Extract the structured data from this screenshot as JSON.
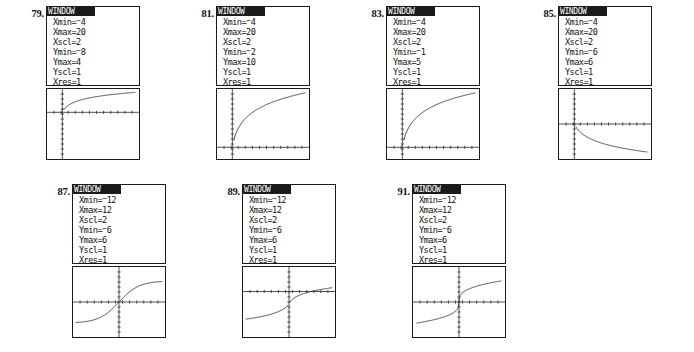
{
  "document": {
    "kind": "graphing-calculator-answer-key",
    "rows": 2,
    "panel_count": 7
  },
  "labels": {
    "window_title": "WINDOW",
    "xmin": "Xmin=",
    "xmax": "Xmax=",
    "xscl": "Xscl=",
    "ymin": "Ymin=",
    "ymax": "Ymax=",
    "yscl": "Yscl=",
    "xres": "Xres="
  },
  "panels": [
    {
      "number": "79.",
      "window": {
        "Xmin": "-4",
        "Xmin_negated": true,
        "Xmax": "20",
        "Xscl": "2",
        "Ymin": "8",
        "Ymin_negated": true,
        "Ymax": "4",
        "Yscl": "1",
        "Xres": "1"
      },
      "graph": {
        "type": "logarithmic-increasing",
        "description": "increasing logarithmic curve with vertical asymptote near x=0",
        "xaxis_fraction": 0.333,
        "yaxis_fraction": 0.1667
      }
    },
    {
      "number": "81.",
      "window": {
        "Xmin": "-4",
        "Xmin_negated": true,
        "Xmax": "20",
        "Xscl": "2",
        "Ymin": "2",
        "Ymin_negated": true,
        "Ymax": "10",
        "Yscl": "1",
        "Xres": "1"
      },
      "graph": {
        "type": "logarithmic-increasing",
        "description": "increasing logarithmic curve with vertical asymptote near x=0",
        "xaxis_fraction": 0.8333,
        "yaxis_fraction": 0.1667
      }
    },
    {
      "number": "83.",
      "window": {
        "Xmin": "-4",
        "Xmin_negated": true,
        "Xmax": "20",
        "Xscl": "2",
        "Ymin": "1",
        "Ymin_negated": true,
        "Ymax": "5",
        "Yscl": "1",
        "Xres": "1"
      },
      "graph": {
        "type": "logarithmic-increasing",
        "description": "increasing logarithmic curve rising from the x-axis",
        "xaxis_fraction": 0.8333,
        "yaxis_fraction": 0.1667
      }
    },
    {
      "number": "85.",
      "window": {
        "Xmin": "-4",
        "Xmin_negated": true,
        "Xmax": "20",
        "Xscl": "2",
        "Ymin": "6",
        "Ymin_negated": true,
        "Ymax": "6",
        "Yscl": "1",
        "Xres": "1"
      },
      "graph": {
        "type": "logarithmic-decreasing",
        "description": "decreasing logarithmic curve falling below the x-axis",
        "xaxis_fraction": 0.5,
        "yaxis_fraction": 0.1667
      }
    },
    {
      "number": "87.",
      "window": {
        "Xmin": "-12",
        "Xmin_negated": true,
        "Xmax": "12",
        "Xscl": "2",
        "Ymin": "6",
        "Ymin_negated": true,
        "Ymax": "6",
        "Yscl": "1",
        "Xres": "1"
      },
      "graph": {
        "type": "sigmoid",
        "description": "S-shaped increasing curve through the origin",
        "xaxis_fraction": 0.5,
        "yaxis_fraction": 0.5
      }
    },
    {
      "number": "89.",
      "window": {
        "Xmin": "-12",
        "Xmin_negated": true,
        "Xmax": "12",
        "Xscl": "2",
        "Ymin": "6",
        "Ymin_negated": true,
        "Ymax": "6",
        "Yscl": "1",
        "Xres": "1"
      },
      "graph": {
        "type": "discontinuous",
        "description": "two increasing branches with a jump discontinuity at x=0",
        "xaxis_fraction": 0.35,
        "yaxis_fraction": 0.5
      }
    },
    {
      "number": "91.",
      "window": {
        "Xmin": "-12",
        "Xmin_negated": true,
        "Xmax": "12",
        "Xscl": "2",
        "Ymin": "6",
        "Ymin_negated": true,
        "Ymax": "6",
        "Yscl": "1",
        "Xres": "1"
      },
      "graph": {
        "type": "cube-root",
        "description": "cube-root shaped increasing curve through the origin",
        "xaxis_fraction": 0.5,
        "yaxis_fraction": 0.5
      }
    }
  ],
  "colors": {
    "ink": "#1a1a1a",
    "curve": "#3a3a3a",
    "paper": "#ffffff",
    "titlebar": "#1b1b1b",
    "titlebar_text": "#ffffff"
  }
}
